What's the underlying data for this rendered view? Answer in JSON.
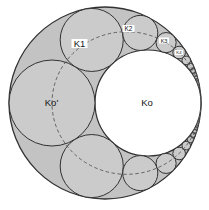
{
  "figure": {
    "viewbox": "0 0 209 210",
    "width": 209,
    "height": 210,
    "colors": {
      "background": "#ffffff",
      "lune_fill": "#c3c3c3",
      "chain_fill": "#cbcbcb",
      "inner_fill": "#ffffff",
      "stroke": "#323232",
      "dashed_stroke": "#585858",
      "label_text": "#161616",
      "label_bg": "#ffffff"
    },
    "outer_circle": {
      "cx": 105,
      "cy": 103,
      "r": 96
    },
    "inner_circle": {
      "cx": 148,
      "cy": 103,
      "r": 53
    },
    "mirror_axis_y": 103,
    "locus_ellipse": {
      "cx": 126.5,
      "cy": 103,
      "rx": 74.5,
      "ry": 71.3,
      "dash": "3.5 2.5",
      "stroke_width": 0.9
    },
    "chain_circles": [
      {
        "n": 0,
        "cx": 52.0,
        "cy": 103.0,
        "r": 43.0
      },
      {
        "n": 1,
        "cx": 91.72,
        "cy": 39.92,
        "r": 31.54
      },
      {
        "n": 2,
        "cx": 140.28,
        "cy": 32.9,
        "r": 17.53
      },
      {
        "n": 3,
        "cx": 166.11,
        "cy": 42.59,
        "r": 10.07
      },
      {
        "n": 4,
        "cx": 179.14,
        "cy": 52.52,
        "r": 6.31
      },
      {
        "n": 5,
        "cx": 186.23,
        "cy": 60.36,
        "r": 4.26
      },
      {
        "n": 6,
        "cx": 190.42,
        "cy": 66.36,
        "r": 3.05
      },
      {
        "n": 7,
        "cx": 193.08,
        "cy": 70.99,
        "r": 2.29
      },
      {
        "n": 8,
        "cx": 194.86,
        "cy": 74.64,
        "r": 1.77
      },
      {
        "n": 9,
        "cx": 196.1,
        "cy": 77.57,
        "r": 1.41
      },
      {
        "n": 10,
        "cx": 197.01,
        "cy": 79.97,
        "r": 1.15
      },
      {
        "n": 11,
        "cx": 197.69,
        "cy": 81.96,
        "r": 0.96
      },
      {
        "n": 12,
        "cx": 198.21,
        "cy": 83.65,
        "r": 0.81
      },
      {
        "n": 13,
        "cx": 198.61,
        "cy": 85.09,
        "r": 0.69
      },
      {
        "n": 14,
        "cx": 198.94,
        "cy": 86.33,
        "r": 0.6
      }
    ],
    "labels": [
      {
        "text": "K1",
        "x": 79.5,
        "y": 43.5,
        "font_size": 9.5,
        "bg": true,
        "bg_w": 16,
        "bg_h": 9
      },
      {
        "text": "K2",
        "x": 128.5,
        "y": 28.5,
        "font_size": 6.5,
        "bg": true,
        "bg_w": 12,
        "bg_h": 7
      },
      {
        "text": "K3",
        "x": 164.0,
        "y": 40.5,
        "font_size": 5.5,
        "bg": true,
        "bg_w": 10,
        "bg_h": 6
      },
      {
        "text": "K4",
        "x": 179.0,
        "y": 52.5,
        "font_size": 4.3,
        "bg": true,
        "bg_w": 8,
        "bg_h": 5
      },
      {
        "text": "Ko'",
        "x": 51.5,
        "y": 102.5,
        "font_size": 9.5,
        "bg": false,
        "bg_w": 0,
        "bg_h": 0
      },
      {
        "text": "Ko",
        "x": 147.0,
        "y": 102.5,
        "font_size": 9.5,
        "bg": false,
        "bg_w": 0,
        "bg_h": 0
      }
    ]
  }
}
